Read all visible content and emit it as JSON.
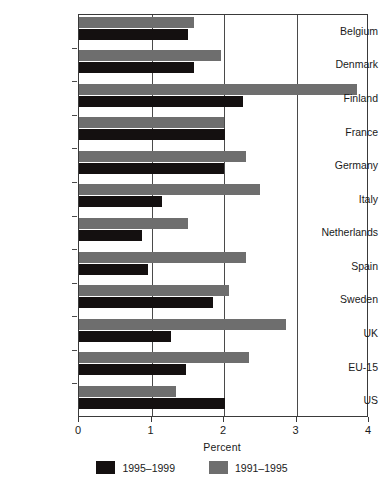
{
  "chart_data": {
    "type": "bar",
    "orientation": "horizontal",
    "title": "",
    "xlabel": "Percent",
    "ylabel": "",
    "xlim": [
      0,
      4
    ],
    "xticks": [
      0,
      1,
      2,
      3,
      4
    ],
    "xtick_labels": [
      "0",
      "1",
      "2",
      "3",
      "4"
    ],
    "grid": true,
    "grid_axis": "x",
    "legend_position": "bottom",
    "categories": [
      "Belgium",
      "Denmark",
      "Finland",
      "France",
      "Germany",
      "Italy",
      "Netherlands",
      "Spain",
      "Sweden",
      "UK",
      "EU-15",
      "US"
    ],
    "series": [
      {
        "name": "1991–1995",
        "color": "#6e6e6e",
        "values": [
          1.58,
          1.96,
          3.83,
          2.0,
          2.3,
          2.5,
          1.51,
          2.3,
          2.07,
          2.85,
          2.34,
          1.34
        ]
      },
      {
        "name": "1995–1999",
        "color": "#141010",
        "values": [
          1.5,
          1.58,
          2.26,
          2.01,
          2.0,
          1.14,
          0.87,
          0.95,
          1.85,
          1.27,
          1.47,
          2.01
        ]
      }
    ]
  },
  "legend": {
    "items": [
      {
        "label": "1995–1999",
        "color": "#141010"
      },
      {
        "label": "1991–1995",
        "color": "#6e6e6e"
      }
    ]
  },
  "axis": {
    "x_title": "Percent"
  }
}
